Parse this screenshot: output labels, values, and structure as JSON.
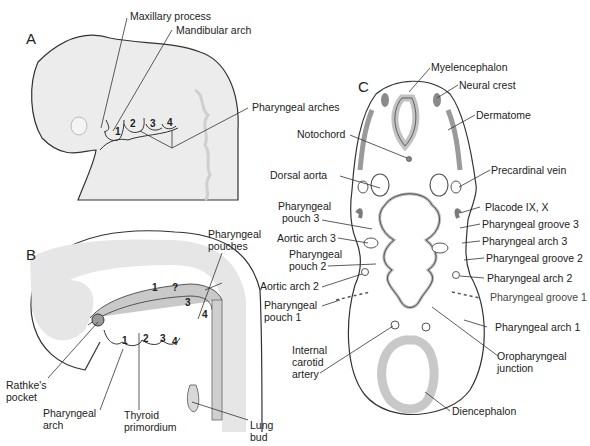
{
  "figure": {
    "panels": [
      {
        "id": "A",
        "label": "A"
      },
      {
        "id": "B",
        "label": "B"
      },
      {
        "id": "C",
        "label": "C"
      }
    ],
    "panel_a": {
      "labels": {
        "maxillary_process": "Maxillary process",
        "mandibular_arch": "Mandibular arch",
        "pharyngeal_arches": "Pharyngeal arches"
      },
      "arch_numbers": [
        "1",
        "2",
        "3",
        "4"
      ]
    },
    "panel_b": {
      "labels": {
        "pharyngeal_pouches_1": "Pharyngeal",
        "pharyngeal_pouches_2": "pouches",
        "rathkes_pocket_1": "Rathke's",
        "rathkes_pocket_2": "pocket",
        "pharyngeal_arch_1": "Pharyngeal",
        "pharyngeal_arch_2": "arch",
        "thyroid_primordium_1": "Thyroid",
        "thyroid_primordium_2": "primordium",
        "lung_bud_1": "Lung",
        "lung_bud_2": "bud"
      },
      "pouch_numbers": [
        "1",
        "2",
        "3",
        "4"
      ],
      "arch_numbers": [
        "1",
        "2",
        "3",
        "4"
      ]
    },
    "panel_c": {
      "labels": {
        "myelencephalon": "Myelencephalon",
        "neural_crest": "Neural crest",
        "dermatome": "Dermatome",
        "notochord": "Notochord",
        "precardinal_vein": "Precardinal vein",
        "dorsal_aorta": "Dorsal aorta",
        "placode": "Placode IX, X",
        "pharyngeal_pouch_3_1": "Pharyngeal",
        "pharyngeal_pouch_3_2": "pouch 3",
        "pharyngeal_groove_3": "Pharyngeal groove 3",
        "aortic_arch_3": "Aortic arch 3",
        "pharyngeal_arch_3": "Pharyngeal arch 3",
        "pharyngeal_pouch_2_1": "Pharyngeal",
        "pharyngeal_pouch_2_2": "pouch 2",
        "pharyngeal_groove_2": "Pharyngeal groove 2",
        "aortic_arch_2": "Aortic arch 2",
        "pharyngeal_arch_2": "Pharyngeal arch 2",
        "pharyngeal_groove_1": "Pharyngeal groove 1",
        "pharyngeal_pouch_1_1": "Pharyngeal",
        "pharyngeal_pouch_1_2": "pouch 1",
        "pharyngeal_arch_1": "Pharyngeal arch 1",
        "internal_carotid_1": "Internal",
        "internal_carotid_2": "carotid",
        "internal_carotid_3": "artery",
        "oropharyngeal_junction_1": "Oropharyngeal",
        "oropharyngeal_junction_2": "junction",
        "diencephalon": "Diencephalon"
      }
    },
    "colors": {
      "tissue_light": "#ececec",
      "tissue_mid": "#d0d0d0",
      "tissue_dark": "#9a9a9a",
      "outline": "#333333"
    }
  }
}
